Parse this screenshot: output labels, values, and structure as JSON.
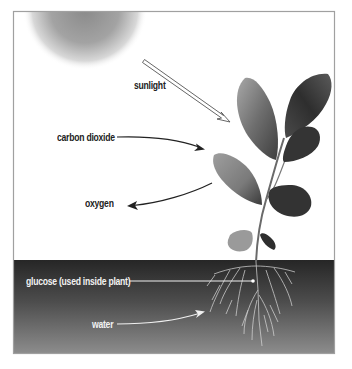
{
  "diagram": {
    "labels": {
      "sunlight": "sunlight",
      "carbon_dioxide": "carbon dioxide",
      "oxygen": "oxygen",
      "glucose": "glucose (used inside plant)",
      "water": "water"
    },
    "elements": {
      "sun": "sun-gradient",
      "plant": "leafy-plant-with-roots",
      "ground": "soil-gradient"
    },
    "colors": {
      "sky": "#ffffff",
      "frame": "#9a9a9a",
      "soil_top": "#2a2a2a",
      "soil_bottom": "#8a8a8a",
      "label_dark": "#222222",
      "label_light": "#f2f2f2",
      "leaf_dark": "#3a3a3a",
      "leaf_light": "#9a9a9a"
    }
  }
}
